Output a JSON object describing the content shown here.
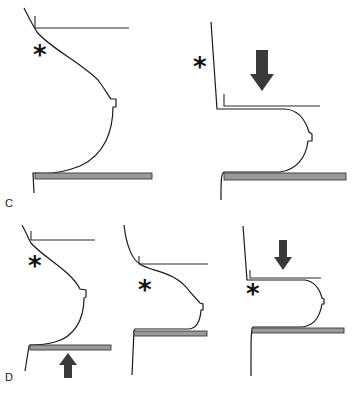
{
  "figure": {
    "rows": [
      {
        "label": "C",
        "panels": [
          {
            "id": "c1",
            "description": "breast before compression, paddle above, plate below",
            "marker": "*",
            "arrow": null
          },
          {
            "id": "c2",
            "description": "breast compressed by paddle from above",
            "marker": "*",
            "arrow": "down"
          }
        ]
      },
      {
        "label": "D",
        "panels": [
          {
            "id": "d1",
            "description": "plate raised from below",
            "marker": "*",
            "arrow": "up"
          },
          {
            "id": "d2",
            "description": "breast resting on elevated plate",
            "marker": "*",
            "arrow": null
          },
          {
            "id": "d3",
            "description": "paddle compressing from above",
            "marker": "*",
            "arrow": "down"
          }
        ]
      }
    ],
    "marker_symbol": "*",
    "colors": {
      "line": "#1a1a1a",
      "plate_fill": "#9a9a9a",
      "arrow_fill": "#3a3a3a"
    }
  }
}
